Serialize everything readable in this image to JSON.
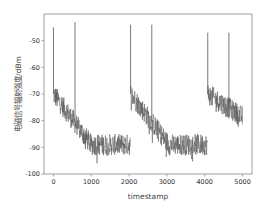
{
  "chart_data": {
    "type": "line",
    "title": "",
    "xlabel": "timestamp",
    "ylabel": "电磁信号辐射强度/dBm",
    "xlim": [
      -250,
      5250
    ],
    "ylim": [
      -100,
      -40
    ],
    "xticks": [
      0,
      1000,
      2000,
      3000,
      4000,
      5000
    ],
    "xtick_labels": [
      "0",
      "1000",
      "2000",
      "3000",
      "4000",
      "5000"
    ],
    "yticks": [
      -100,
      -90,
      -80,
      -70,
      -60,
      -50
    ],
    "ytick_labels": [
      "-100",
      "-90",
      "-80",
      "-70",
      "-60",
      "-50"
    ],
    "grid": false,
    "line_color": "#555555",
    "series": [
      {
        "name": "signal",
        "description": "Noisy sawtooth: decays from about -70 to about -90 dBm over each cycle, with noise roughly ±4 dBm; resets near t=0, 2040, 4080",
        "segments": [
          {
            "t_start": 0,
            "t_end": 2030,
            "start_level": -70,
            "floor_level": -89,
            "floor_from": 1000
          },
          {
            "t_start": 2040,
            "t_end": 4070,
            "start_level": -70,
            "floor_level": -89,
            "floor_from": 3050
          },
          {
            "t_start": 4080,
            "t_end": 5000,
            "start_level": -70,
            "floor_level": -88,
            "floor_from": 6000
          }
        ],
        "spikes": [
          {
            "t": 0,
            "value": -45
          },
          {
            "t": 570,
            "value": -43
          },
          {
            "t": 2040,
            "value": -44
          },
          {
            "t": 2600,
            "value": -44
          },
          {
            "t": 4080,
            "value": -47
          },
          {
            "t": 4640,
            "value": -47
          }
        ]
      }
    ]
  }
}
